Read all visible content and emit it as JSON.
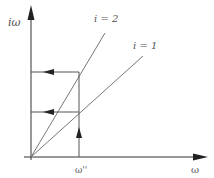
{
  "diagram": {
    "y_axis_label": "iω",
    "x_axis_label": "ω",
    "tick_label": "ω''",
    "lines": [
      {
        "label": "i = 2",
        "slope_desc": "steeper line"
      },
      {
        "label": "i = 1",
        "slope_desc": "shallower line"
      }
    ],
    "colors": {
      "axis": "#333333",
      "line": "#777777",
      "arrow": "#222222",
      "text": "#555555"
    }
  }
}
